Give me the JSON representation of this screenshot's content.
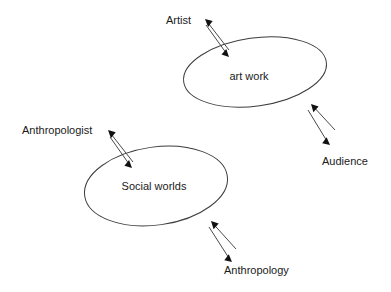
{
  "diagram": {
    "background_color": "#ffffff",
    "stroke_color": "#3c3c3c",
    "arrow_color": "#4a4a4a",
    "text_color": "#1a1a1a",
    "nodes": [
      {
        "id": "art-work",
        "label": "art work",
        "shape": "ellipse",
        "cx": 255,
        "cy": 72,
        "rx": 72,
        "ry": 34,
        "rotation": -8,
        "label_x": 249,
        "label_y": 80
      },
      {
        "id": "social-worlds",
        "label": "Social worlds",
        "shape": "ellipse",
        "cx": 156,
        "cy": 186,
        "rx": 72,
        "ry": 39,
        "rotation": -8,
        "label_x": 154,
        "label_y": 190
      }
    ],
    "external_labels": [
      {
        "id": "artist",
        "label": "Artist",
        "x": 166,
        "y": 24,
        "anchor": "start"
      },
      {
        "id": "audience",
        "label": "Audience",
        "x": 322,
        "y": 165,
        "anchor": "start"
      },
      {
        "id": "anthropologist",
        "label": "Anthropologist",
        "x": 22,
        "y": 134,
        "anchor": "start"
      },
      {
        "id": "anthropology",
        "label": "Anthropology",
        "x": 224,
        "y": 274,
        "anchor": "start"
      }
    ],
    "connectors": [
      {
        "id": "artist-outward",
        "from": "art work",
        "to": "Artist",
        "direction": "outbound",
        "x1": 229,
        "y1": 50,
        "x2": 205,
        "y2": 19
      },
      {
        "id": "artist-inward",
        "from": "Artist",
        "to": "art work",
        "direction": "inbound",
        "x1": 206,
        "y1": 25,
        "x2": 229,
        "y2": 57
      },
      {
        "id": "audience-inward",
        "from": "Audience",
        "to": "art work",
        "direction": "inbound",
        "x1": 335,
        "y1": 130,
        "x2": 311,
        "y2": 104
      },
      {
        "id": "audience-outward",
        "from": "art work",
        "to": "Audience",
        "direction": "outbound",
        "x1": 308,
        "y1": 110,
        "x2": 330,
        "y2": 145
      },
      {
        "id": "anthropologist-outward",
        "from": "Social worlds",
        "to": "Anthropologist",
        "direction": "outbound",
        "x1": 133,
        "y1": 162,
        "x2": 108,
        "y2": 130
      },
      {
        "id": "anthropologist-inward",
        "from": "Anthropologist",
        "to": "Social worlds",
        "direction": "inbound",
        "x1": 110,
        "y1": 137,
        "x2": 132,
        "y2": 168
      },
      {
        "id": "anthropology-inward",
        "from": "Anthropology",
        "to": "Social worlds",
        "direction": "inbound",
        "x1": 236,
        "y1": 249,
        "x2": 211,
        "y2": 221
      },
      {
        "id": "anthropology-outward",
        "from": "Social worlds",
        "to": "Anthropology",
        "direction": "outbound",
        "x1": 209,
        "y1": 227,
        "x2": 232,
        "y2": 262
      }
    ]
  }
}
